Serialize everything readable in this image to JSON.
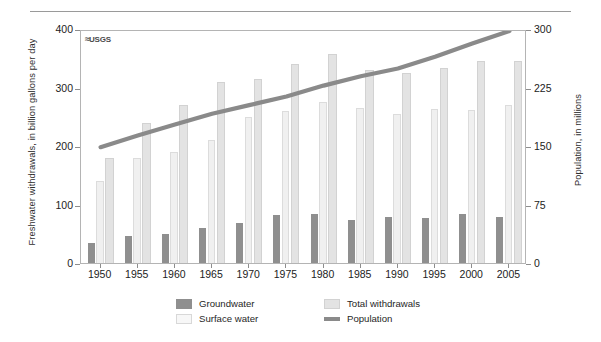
{
  "logo": {
    "text": "USGS",
    "wave": "≈"
  },
  "axes": {
    "left_title": "Freshwater withdrawals, in billion gallons per day",
    "right_title": "Population, in millions",
    "left_ticks": [
      0,
      100,
      200,
      300,
      400
    ],
    "right_ticks": [
      0,
      75,
      150,
      225,
      300
    ]
  },
  "legend": {
    "items": [
      {
        "label": "Groundwater",
        "swatch": "ground",
        "color": "#8f8f8f"
      },
      {
        "label": "Surface water",
        "swatch": "surface",
        "color": "#f7f7f7"
      },
      {
        "label": "Total withdrawals",
        "swatch": "total",
        "color": "#e3e3e3"
      },
      {
        "label": "Population",
        "swatch": "line",
        "color": "#8a8a8a"
      }
    ]
  },
  "chart_data": {
    "type": "bar",
    "title": "",
    "xlabel": "",
    "ylabel": "Freshwater withdrawals, in billion gallons per day",
    "y2label": "Population, in millions",
    "ylim": [
      0,
      400
    ],
    "y2lim": [
      0,
      300
    ],
    "grid": false,
    "legend_position": "bottom",
    "categories": [
      "1950",
      "1955",
      "1960",
      "1965",
      "1970",
      "1975",
      "1980",
      "1985",
      "1990",
      "1995",
      "2000",
      "2005"
    ],
    "series": [
      {
        "name": "Groundwater",
        "type": "bar",
        "axis": "left",
        "color": "#8f8f8f",
        "values": [
          34,
          47,
          50,
          60,
          68,
          82,
          83,
          73,
          79,
          77,
          83,
          79
        ]
      },
      {
        "name": "Surface water",
        "type": "bar",
        "axis": "left",
        "color": "#f7f7f7",
        "values": [
          140,
          180,
          190,
          210,
          250,
          260,
          275,
          265,
          255,
          264,
          262,
          270
        ]
      },
      {
        "name": "Total withdrawals",
        "type": "bar",
        "axis": "left",
        "color": "#e3e3e3",
        "values": [
          180,
          240,
          270,
          310,
          315,
          340,
          358,
          330,
          325,
          333,
          345,
          346
        ]
      },
      {
        "name": "Population",
        "type": "line",
        "axis": "right",
        "color": "#8a8a8a",
        "values": [
          151,
          166,
          180,
          194,
          205,
          216,
          230,
          242,
          252,
          267,
          284,
          300
        ]
      }
    ]
  }
}
